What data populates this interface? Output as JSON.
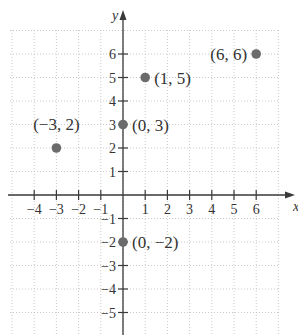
{
  "chart_data": {
    "type": "scatter",
    "title": "",
    "xlabel": "x",
    "ylabel": "y",
    "xlim": [
      -5,
      7
    ],
    "ylim": [
      -6,
      7
    ],
    "grid": true,
    "grid_style": "dotted",
    "x_ticks": [
      -4,
      -3,
      -2,
      -1,
      1,
      2,
      3,
      4,
      5,
      6
    ],
    "x_tick_labels": [
      "−4",
      "−3",
      "−2",
      "−1",
      "1",
      "2",
      "3",
      "4",
      "5",
      "6"
    ],
    "y_ticks": [
      6,
      5,
      4,
      3,
      2,
      1,
      -1,
      -2,
      -3,
      -4,
      -5
    ],
    "y_tick_labels": [
      "6",
      "5",
      "4",
      "3",
      "2",
      "1",
      "−1",
      "−2",
      "−3",
      "−4",
      "−5"
    ],
    "points": [
      {
        "x": -3,
        "y": 2,
        "label": "(−3, 2)",
        "label_pos": "above"
      },
      {
        "x": 0,
        "y": 3,
        "label": "(0, 3)",
        "label_pos": "right"
      },
      {
        "x": 1,
        "y": 5,
        "label": "(1, 5)",
        "label_pos": "right"
      },
      {
        "x": 6,
        "y": 6,
        "label": "(6, 6)",
        "label_pos": "left"
      },
      {
        "x": 0,
        "y": -2,
        "label": "(0, −2)",
        "label_pos": "right"
      }
    ],
    "colors": {
      "point": "#6b6b6b",
      "axis": "#3a3a3a",
      "grid": "#bdbdbd"
    }
  }
}
